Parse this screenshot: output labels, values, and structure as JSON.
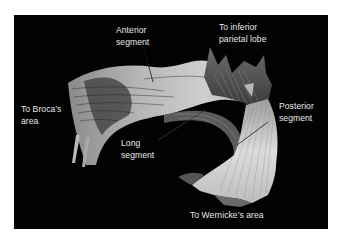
{
  "figure": {
    "background_color": "#020202",
    "label_color": "#e8e8e8",
    "tract_colors": {
      "light": "#c9c9c9",
      "mid": "#9a9a9a",
      "dark": "#4a4a4a"
    }
  },
  "labels": {
    "anterior_segment": {
      "line1": "Anterior",
      "line2": "segment"
    },
    "inferior_parietal": {
      "line1": "To inferior",
      "line2": "parietal lobe"
    },
    "broca": {
      "line1": "To Broca’s",
      "line2": "area"
    },
    "posterior_segment": {
      "line1": "Posterior",
      "line2": "segment"
    },
    "long_segment": {
      "line1": "Long",
      "line2": "segment"
    },
    "wernicke": {
      "line1": "To Wernicke’s area"
    }
  }
}
